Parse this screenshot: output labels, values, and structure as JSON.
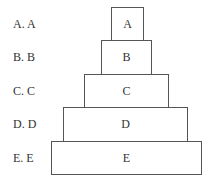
{
  "options": [
    {
      "label": "A. A",
      "box_text": "A"
    },
    {
      "label": "B. B",
      "box_text": "B"
    },
    {
      "label": "C. C",
      "box_text": "C"
    },
    {
      "label": "D. D",
      "box_text": "D"
    },
    {
      "label": "E. E",
      "box_text": "E"
    }
  ]
}
